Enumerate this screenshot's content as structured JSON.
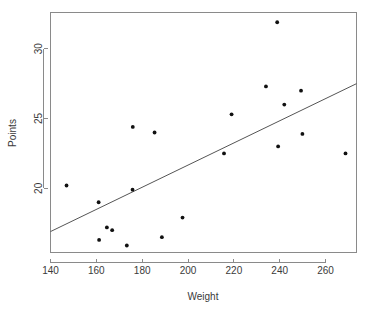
{
  "chart_data": {
    "type": "scatter",
    "title": "",
    "xlabel": "Weight",
    "ylabel": "Points",
    "xlim": [
      140.0,
      273.5
    ],
    "ylim": [
      15.4,
      32.6
    ],
    "xticks": [
      140,
      160,
      180,
      200,
      220,
      240,
      260
    ],
    "xtick_labels": [
      "140",
      "160",
      "180",
      "200",
      "220",
      "240",
      "260"
    ],
    "yticks": [
      20,
      25,
      30
    ],
    "ytick_labels": [
      "20",
      "25",
      "30"
    ],
    "grid": false,
    "legend": null,
    "points": [
      {
        "x": 147.0,
        "y": 20.2
      },
      {
        "x": 161.0,
        "y": 19.0
      },
      {
        "x": 161.2,
        "y": 16.3
      },
      {
        "x": 164.6,
        "y": 17.2
      },
      {
        "x": 166.9,
        "y": 17.0
      },
      {
        "x": 173.3,
        "y": 15.9
      },
      {
        "x": 175.8,
        "y": 19.9
      },
      {
        "x": 175.9,
        "y": 24.4
      },
      {
        "x": 185.4,
        "y": 24.0
      },
      {
        "x": 188.6,
        "y": 16.5
      },
      {
        "x": 197.6,
        "y": 17.9
      },
      {
        "x": 215.7,
        "y": 22.5
      },
      {
        "x": 219.0,
        "y": 25.3
      },
      {
        "x": 234.0,
        "y": 27.3
      },
      {
        "x": 238.9,
        "y": 31.9
      },
      {
        "x": 239.3,
        "y": 23.0
      },
      {
        "x": 242.0,
        "y": 26.0
      },
      {
        "x": 249.3,
        "y": 27.0
      },
      {
        "x": 249.9,
        "y": 23.9
      },
      {
        "x": 268.7,
        "y": 22.5
      }
    ],
    "fit_line": {
      "name": "linear regression",
      "x_start": 140.0,
      "y_start": 16.9,
      "x_end": 273.5,
      "y_end": 27.5
    },
    "colors": {
      "point": "#111111",
      "line": "#555555",
      "axis": "#8a8a8a",
      "text": "#3a3a3a",
      "background": "#ffffff"
    }
  }
}
